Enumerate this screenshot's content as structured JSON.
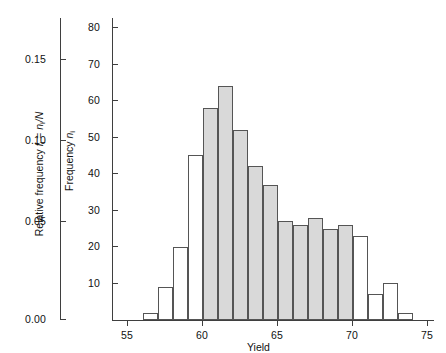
{
  "chart_data": {
    "type": "bar",
    "title": "",
    "subtitle": "",
    "xlabel": "Yield",
    "ylabel": "Frequency n",
    "ylabel_secondary": "Relative frequency f = n/N",
    "grid": false,
    "legend": null,
    "xlim": [
      54.2,
      76.5
    ],
    "ylim": [
      0,
      85
    ],
    "xticks": [
      55,
      60,
      65,
      70,
      75
    ],
    "yticks": [
      10,
      20,
      30,
      40,
      50,
      60,
      70,
      80
    ],
    "yticks_secondary": [
      0.0,
      0.05,
      0.1,
      0.15
    ],
    "bin_width": 1,
    "bins": [
      {
        "left": 56,
        "right": 57,
        "value": 2,
        "shaded": false
      },
      {
        "left": 57,
        "right": 58,
        "value": 9,
        "shaded": false
      },
      {
        "left": 58,
        "right": 59,
        "value": 20,
        "shaded": false
      },
      {
        "left": 59,
        "right": 60,
        "value": 45,
        "shaded": false
      },
      {
        "left": 60,
        "right": 61,
        "value": 58,
        "shaded": true
      },
      {
        "left": 61,
        "right": 62,
        "value": 64,
        "shaded": true
      },
      {
        "left": 62,
        "right": 63,
        "value": 52,
        "shaded": true
      },
      {
        "left": 63,
        "right": 64,
        "value": 42,
        "shaded": true
      },
      {
        "left": 64,
        "right": 65,
        "value": 37,
        "shaded": true
      },
      {
        "left": 65,
        "right": 66,
        "value": 27,
        "shaded": true
      },
      {
        "left": 66,
        "right": 67,
        "value": 26,
        "shaded": true
      },
      {
        "left": 67,
        "right": 68,
        "value": 28,
        "shaded": true
      },
      {
        "left": 68,
        "right": 69,
        "value": 25,
        "shaded": true
      },
      {
        "left": 69,
        "right": 70,
        "value": 26,
        "shaded": true
      },
      {
        "left": 70,
        "right": 71,
        "value": 23,
        "shaded": false
      },
      {
        "left": 71,
        "right": 72,
        "value": 7,
        "shaded": false
      },
      {
        "left": 72,
        "right": 73,
        "value": 10,
        "shaded": false
      },
      {
        "left": 73,
        "right": 74,
        "value": 2,
        "shaded": false
      }
    ],
    "categories": [
      56,
      57,
      58,
      59,
      60,
      61,
      62,
      63,
      64,
      65,
      66,
      67,
      68,
      69,
      70,
      71,
      72,
      73
    ],
    "values": [
      2,
      9,
      20,
      45,
      58,
      64,
      52,
      42,
      37,
      27,
      26,
      28,
      25,
      26,
      23,
      7,
      10,
      2
    ],
    "colors": {
      "shaded_fill": "#d9d9d9",
      "unshaded_fill": "#ffffff",
      "bar_stroke": "#555555",
      "axis": "#3f3f3f",
      "text": "#111111",
      "background": "#ffffff"
    }
  },
  "axes": {
    "x": {
      "label": "Yield",
      "tick_labels": [
        "55",
        "60",
        "65",
        "70",
        "75"
      ]
    },
    "y_primary": {
      "label_prefix": "Frequency ",
      "label_symbol": "n",
      "label_sub": "i",
      "tick_labels": [
        "80",
        "70",
        "60",
        "50",
        "40",
        "30",
        "20",
        "10"
      ]
    },
    "y_secondary": {
      "label_prefix": "Relative frequency ",
      "label_sym1": "f",
      "label_sub1": "i",
      "label_mid": " = ",
      "label_sym2": "n",
      "label_sub2": "i",
      "label_suffix": "/N",
      "tick_labels": [
        "0.15",
        "0.10",
        "0.05",
        "0.00"
      ]
    }
  }
}
